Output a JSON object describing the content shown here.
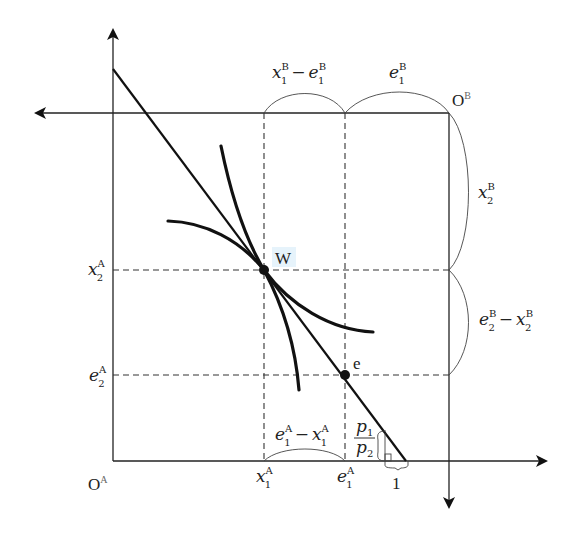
{
  "diagram": {
    "type": "edgeworth-box",
    "origins": {
      "A": {
        "base": "O",
        "sup": "A"
      },
      "B": {
        "base": "O",
        "sup": "B"
      }
    },
    "points": {
      "W": {
        "label": "W"
      },
      "e": {
        "label": "e"
      }
    },
    "top_labels": {
      "left": {
        "base": "x",
        "sup": "B",
        "sub": "1",
        "op": "−",
        "base2": "e",
        "sup2": "B",
        "sub2": "1"
      },
      "right": {
        "base": "e",
        "sup": "B",
        "sub": "1"
      }
    },
    "right_labels": {
      "upper": {
        "base": "x",
        "sup": "B",
        "sub": "2"
      },
      "lower": {
        "base": "e",
        "sup": "B",
        "sub": "2",
        "op": "−",
        "base2": "x",
        "sup2": "B",
        "sub2": "2"
      }
    },
    "left_labels": {
      "upper": {
        "base": "x",
        "sup": "A",
        "sub": "2"
      },
      "lower": {
        "base": "e",
        "sup": "A",
        "sub": "2"
      }
    },
    "bottom_labels": {
      "x1A": {
        "base": "x",
        "sup": "A",
        "sub": "1"
      },
      "e1A": {
        "base": "e",
        "sup": "A",
        "sub": "1"
      },
      "between": {
        "base": "e",
        "sup": "A",
        "sub": "1",
        "op": "−",
        "base2": "x",
        "sup2": "A",
        "sub2": "1"
      },
      "unit": "1"
    },
    "slope_label": {
      "num": "p",
      "num_sub": "1",
      "den": "p",
      "den_sub": "2"
    }
  }
}
